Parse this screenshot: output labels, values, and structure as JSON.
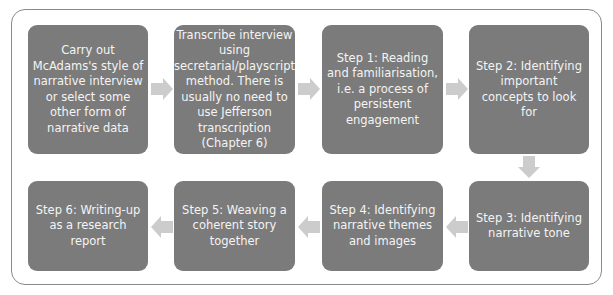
{
  "diagram": {
    "type": "flowchart",
    "colors": {
      "box": "#7b7b7b",
      "text": "#f4f4f4",
      "arrow": "#cccccc",
      "frame": "#8a8a8a"
    },
    "steps": [
      {
        "id": "intro",
        "label": "Carry out McAdams's style of narrative interview or select some other form of narrative data"
      },
      {
        "id": "transcribe",
        "label": "Transcribe interview using secretarial/playscript method. There is usually no need to use Jefferson transcription (Chapter 6)"
      },
      {
        "id": "step1",
        "label": "Step 1: Reading and familiarisation, i.e. a process of persistent engagement"
      },
      {
        "id": "step2",
        "label": "Step 2: Identifying important concepts to look for"
      },
      {
        "id": "step3",
        "label": "Step 3: Identifying narrative tone"
      },
      {
        "id": "step4",
        "label": "Step 4: Identifying narrative themes and images"
      },
      {
        "id": "step5",
        "label": "Step 5: Weaving a coherent story together"
      },
      {
        "id": "step6",
        "label": "Step 6: Writing-up as a research report"
      }
    ]
  }
}
